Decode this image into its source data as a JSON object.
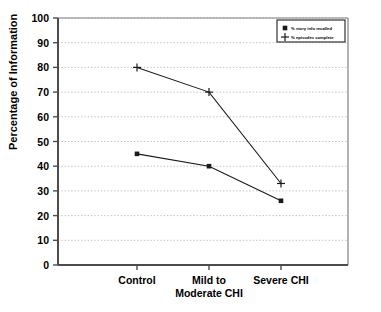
{
  "chart_data": {
    "type": "line",
    "title": "",
    "xlabel": "",
    "ylabel": "Percentage of Information",
    "categories": [
      "Control",
      "Mild to\nModerate CHI",
      "Severe CHI"
    ],
    "category_labels": [
      {
        "line1": "Control",
        "line2": ""
      },
      {
        "line1": "Mild to",
        "line2": "Moderate CHI"
      },
      {
        "line1": "Severe CHI",
        "line2": ""
      }
    ],
    "ylim": [
      0,
      100
    ],
    "yticks": [
      0,
      10,
      20,
      30,
      40,
      50,
      60,
      70,
      80,
      90,
      100
    ],
    "ytick_labels": [
      "0",
      "10",
      "20",
      "30",
      "40",
      "50",
      "60",
      "70",
      "80",
      "90",
      "100"
    ],
    "grid": true,
    "grid_axis": "y",
    "legend_position": "top-right",
    "series": [
      {
        "name": "% story info recalled",
        "marker": "square",
        "values": [
          45,
          40,
          26
        ]
      },
      {
        "name": "% episodes complete",
        "marker": "plus",
        "values": [
          80,
          70,
          33
        ]
      }
    ]
  },
  "legend": {
    "entries": [
      {
        "label": "% story info recalled",
        "marker": "square"
      },
      {
        "label": "% episodes complete",
        "marker": "plus"
      }
    ]
  },
  "colors": {
    "line": "#1a1a1a",
    "axis": "#4d4d4d",
    "grid": "#b3b3b3",
    "frame": "#808080",
    "background": "#ffffff"
  }
}
